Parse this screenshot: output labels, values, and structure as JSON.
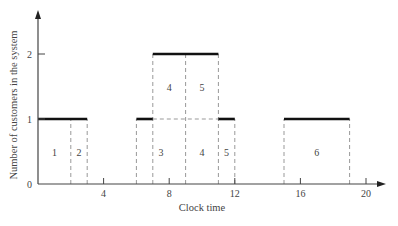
{
  "chart_data": {
    "type": "line",
    "subtype": "step",
    "title": "",
    "xlabel": "Clock time",
    "ylabel": "Number of customers in the system",
    "xlim": [
      0,
      21
    ],
    "ylim": [
      0,
      2.6
    ],
    "x_ticks": [
      4,
      8,
      12,
      16,
      20
    ],
    "x_tick_labels": [
      "4",
      "8",
      "12",
      "16",
      "20"
    ],
    "y_ticks": [
      0,
      1,
      2
    ],
    "y_tick_labels": [
      "0",
      "1",
      "2"
    ],
    "grid": false,
    "legend": null,
    "series": [
      {
        "name": "Number of customers in the system",
        "steps": [
          {
            "x_start": 0,
            "x_end": 3,
            "y": 1
          },
          {
            "x_start": 3,
            "x_end": 6,
            "y": 0
          },
          {
            "x_start": 6,
            "x_end": 7,
            "y": 1
          },
          {
            "x_start": 7,
            "x_end": 11,
            "y": 2
          },
          {
            "x_start": 11,
            "x_end": 12,
            "y": 1
          },
          {
            "x_start": 12,
            "x_end": 15,
            "y": 0
          },
          {
            "x_start": 15,
            "x_end": 19,
            "y": 1
          },
          {
            "x_start": 19,
            "x_end": 21,
            "y": 0
          }
        ]
      }
    ],
    "customer_blocks": [
      {
        "label": "1",
        "x_start": 0,
        "x_end": 2,
        "y_low": 0,
        "y_high": 1
      },
      {
        "label": "2",
        "x_start": 2,
        "x_end": 3,
        "y_low": 0,
        "y_high": 1
      },
      {
        "label": "3",
        "x_start": 6,
        "x_end": 9,
        "y_low": 0,
        "y_high": 1
      },
      {
        "label": "4",
        "x_start": 9,
        "x_end": 11,
        "y_low": 0,
        "y_high": 1
      },
      {
        "label": "5",
        "x_start": 11,
        "x_end": 12,
        "y_low": 0,
        "y_high": 1
      },
      {
        "label": "4",
        "x_start": 7,
        "x_end": 9,
        "y_low": 1,
        "y_high": 2
      },
      {
        "label": "5",
        "x_start": 9,
        "x_end": 11,
        "y_low": 1,
        "y_high": 2
      },
      {
        "label": "6",
        "x_start": 15,
        "x_end": 19,
        "y_low": 0,
        "y_high": 1
      }
    ],
    "dashed_verticals": [
      2,
      3,
      6,
      7,
      9,
      11,
      12,
      15,
      19
    ]
  }
}
